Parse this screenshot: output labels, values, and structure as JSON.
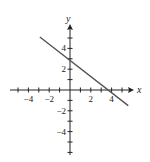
{
  "chart_data": {
    "type": "line",
    "title": "",
    "xlabel": "x",
    "ylabel": "y",
    "xlim": [
      -5.5,
      5.5
    ],
    "ylim": [
      -6,
      6
    ],
    "x_ticks": [
      -5,
      -4,
      -3,
      -2,
      -1,
      1,
      2,
      3,
      4,
      5
    ],
    "y_ticks": [
      -6,
      -5,
      -4,
      -3,
      -2,
      -1,
      1,
      2,
      3,
      4,
      5
    ],
    "x_tick_labels": [
      {
        "value": -4,
        "label": "−4"
      },
      {
        "value": -2,
        "label": "−2"
      },
      {
        "value": 2,
        "label": "2"
      },
      {
        "value": 4,
        "label": "4"
      }
    ],
    "y_tick_labels": [
      {
        "value": 4,
        "label": "4"
      },
      {
        "value": 2,
        "label": "2"
      },
      {
        "value": -2,
        "label": "−2"
      },
      {
        "value": -4,
        "label": "−4"
      }
    ],
    "grid": false,
    "series": [
      {
        "name": "line",
        "x": [
          -2.9,
          5.6
        ],
        "y": [
          5.1,
          -1.5
        ],
        "color": "#555555"
      }
    ]
  }
}
